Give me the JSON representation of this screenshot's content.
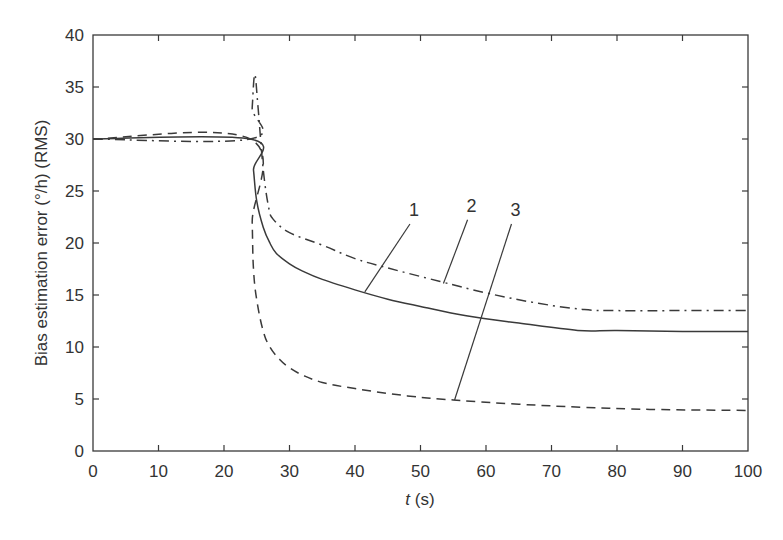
{
  "chart_data": {
    "type": "line",
    "title": "",
    "xlabel_italic": "t",
    "xlabel_rest": " (s)",
    "xlabel": "t (s)",
    "ylabel": "Bias estimation error (°/h) (RMS)",
    "xlim": [
      0,
      100
    ],
    "ylim": [
      0,
      40
    ],
    "xticks": [
      0,
      10,
      20,
      30,
      40,
      50,
      60,
      70,
      80,
      90,
      100
    ],
    "yticks": [
      0,
      5,
      10,
      15,
      20,
      25,
      30,
      35,
      40
    ],
    "grid": false,
    "legend": "none (curves annotated with numeric labels 1, 2, 3 via leader lines)",
    "series": [
      {
        "name": "1",
        "style": "solid",
        "points": [
          [
            0,
            30
          ],
          [
            24,
            30
          ],
          [
            24.5,
            27
          ],
          [
            25,
            24
          ],
          [
            26,
            21.5
          ],
          [
            27,
            20
          ],
          [
            28,
            19
          ],
          [
            30,
            18
          ],
          [
            32,
            17.3
          ],
          [
            35,
            16.5
          ],
          [
            41,
            15.3
          ],
          [
            45,
            14.6
          ],
          [
            50,
            13.9
          ],
          [
            57,
            13
          ],
          [
            65,
            12.3
          ],
          [
            74,
            11.6
          ],
          [
            80,
            11.6
          ],
          [
            90,
            11.5
          ],
          [
            100,
            11.5
          ]
        ]
      },
      {
        "name": "2",
        "style": "dash-dot",
        "points": [
          [
            0,
            30
          ],
          [
            24,
            30
          ],
          [
            24.3,
            33
          ],
          [
            24.7,
            36.2
          ],
          [
            25.2,
            33
          ],
          [
            26,
            27
          ],
          [
            26.8,
            23.5
          ],
          [
            27.5,
            22.3
          ],
          [
            30,
            21
          ],
          [
            35,
            19.8
          ],
          [
            40,
            18.5
          ],
          [
            45,
            17.6
          ],
          [
            53,
            16.3
          ],
          [
            60,
            15.2
          ],
          [
            68,
            14.2
          ],
          [
            75,
            13.6
          ],
          [
            80,
            13.5
          ],
          [
            90,
            13.5
          ],
          [
            100,
            13.5
          ]
        ]
      },
      {
        "name": "3",
        "style": "dashed",
        "points": [
          [
            0,
            30
          ],
          [
            24,
            30
          ],
          [
            24.3,
            22
          ],
          [
            24.5,
            17.5
          ],
          [
            25,
            14.5
          ],
          [
            26,
            11.5
          ],
          [
            27,
            10
          ],
          [
            28.5,
            8.8
          ],
          [
            30,
            8
          ],
          [
            32,
            7.3
          ],
          [
            35,
            6.6
          ],
          [
            40,
            6
          ],
          [
            48,
            5.3
          ],
          [
            55,
            4.9
          ],
          [
            65,
            4.5
          ],
          [
            75,
            4.2
          ],
          [
            85,
            4
          ],
          [
            100,
            3.9
          ]
        ]
      }
    ],
    "annotations": [
      {
        "text": "1",
        "label_x": 49,
        "label_y": 22.6,
        "points_to": [
          41.5,
          15.3
        ]
      },
      {
        "text": "2",
        "label_x": 57.8,
        "label_y": 23,
        "points_to": [
          53.5,
          16.1
        ]
      },
      {
        "text": "3",
        "label_x": 64.5,
        "label_y": 22.6,
        "points_to": [
          55.2,
          4.9
        ]
      }
    ]
  }
}
